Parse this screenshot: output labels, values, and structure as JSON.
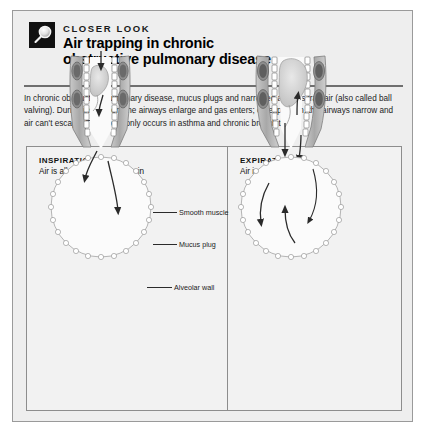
{
  "document": {
    "kicker": "CLOSER LOOK",
    "title_line1": "Air trapping in chronic",
    "title_line2": "obstructive pulmonary disease",
    "icon": "magnifier-icon",
    "intro": "In chronic obstructive pulmonary disease, mucus plugs and narrowed airways trap air (also called ball valving). During inspiration, the airways enlarge and gas enters; on expiration, the airways narrow and air can't escape. This commonly occurs in asthma and chronic bronchitis."
  },
  "panels": [
    {
      "id": "inspiration",
      "title": "INSPIRATION",
      "subtitle": "Air is allowed to flow freely in"
    },
    {
      "id": "expiration",
      "title": "EXPIRATION",
      "subtitle": "Air is trapped"
    }
  ],
  "callouts": [
    {
      "id": "smooth-muscle",
      "label": "Smooth muscle"
    },
    {
      "id": "mucus-plug",
      "label": "Mucus plug"
    },
    {
      "id": "alveolar-wall",
      "label": "Alveolar wall"
    }
  ],
  "colors": {
    "page_background": "#ffffff",
    "frame_background": "#eeeeee",
    "panel_background": "#f2f2f2",
    "border": "#8d8d8d",
    "rule": "#6f6f6f",
    "text": "#1c1c1c",
    "icon_background": "#111111",
    "artwork_ink": "#4a4a4a"
  }
}
